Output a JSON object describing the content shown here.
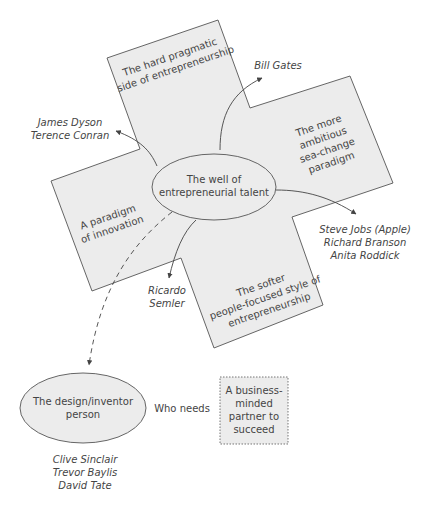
{
  "diagram": {
    "center_node": {
      "lines": [
        "The well of",
        "entrepreneurial talent"
      ]
    },
    "arms": [
      {
        "id": "top",
        "lines": [
          "The hard pragmatic",
          "side of entrepreneurship"
        ]
      },
      {
        "id": "right",
        "lines": [
          "The more",
          "ambitious",
          "sea-change",
          "paradigm"
        ]
      },
      {
        "id": "bottom",
        "lines": [
          "The softer",
          "people-focused style of",
          "entrepreneurship"
        ]
      },
      {
        "id": "left",
        "lines": [
          "A paradigm",
          "of innovation"
        ]
      }
    ],
    "examples": {
      "top": [
        "Bill Gates"
      ],
      "left": [
        "James Dyson",
        "Terence Conran"
      ],
      "right": [
        "Steve Jobs (Apple)",
        "Richard Branson",
        "Anita Roddick"
      ],
      "bottom": [
        "Ricardo",
        "Semler"
      ]
    },
    "inventor_node": {
      "lines": [
        "The design/inventor",
        "person"
      ],
      "examples": [
        "Clive Sinclair",
        "Trevor Baylis",
        "David Tate"
      ]
    },
    "connector_label": "Who needs",
    "partner_box": {
      "lines": [
        "A business-",
        "minded",
        "partner to",
        "succeed"
      ]
    },
    "colors": {
      "shape_fill": "#ececec",
      "stroke": "#555555",
      "text": "#444444"
    }
  }
}
